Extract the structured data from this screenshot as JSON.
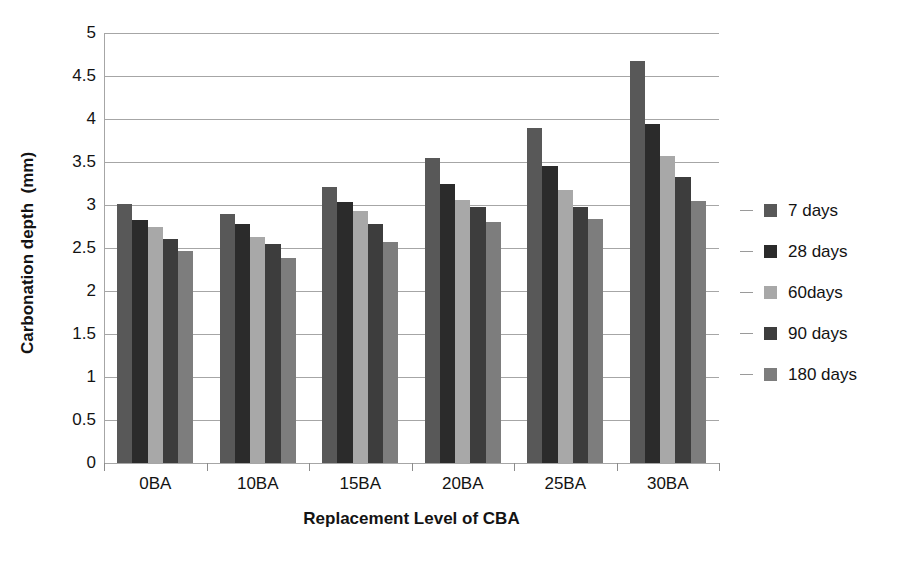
{
  "chart_data": {
    "type": "bar",
    "title": "",
    "xlabel": "Replacement Level of CBA",
    "ylabel": "Carbonation depth  (mm)",
    "categories": [
      "0BA",
      "10BA",
      "15BA",
      "20BA",
      "25BA",
      "30BA"
    ],
    "series": [
      {
        "name": "7 days",
        "color": "#585858",
        "values": [
          3.01,
          2.9,
          3.21,
          3.55,
          3.9,
          4.68
        ]
      },
      {
        "name": "28 days",
        "color": "#2b2b2b",
        "values": [
          2.83,
          2.78,
          3.03,
          3.24,
          3.45,
          3.94
        ]
      },
      {
        "name": "60days",
        "color": "#a8a8a8",
        "values": [
          2.75,
          2.63,
          2.93,
          3.06,
          3.17,
          3.57
        ]
      },
      {
        "name": "90 days",
        "color": "#3d3d3d",
        "values": [
          2.61,
          2.55,
          2.78,
          2.98,
          2.98,
          3.33
        ]
      },
      {
        "name": "180 days",
        "color": "#7d7d7d",
        "values": [
          2.46,
          2.38,
          2.57,
          2.8,
          2.84,
          3.05
        ]
      }
    ],
    "ylim": [
      0,
      5
    ],
    "ytick_values": [
      0,
      0.5,
      1,
      1.5,
      2,
      2.5,
      3,
      3.5,
      4,
      4.5,
      5
    ],
    "ytick_labels": [
      "0",
      "0.5",
      "1",
      "1.5",
      "2",
      "2.5",
      "3",
      "3.5",
      "4",
      "4.5",
      "5"
    ],
    "grid": true,
    "legend_position": "right",
    "background": "#ffffff",
    "axis_color": "#a6a6a6",
    "text_color": "#131313"
  }
}
